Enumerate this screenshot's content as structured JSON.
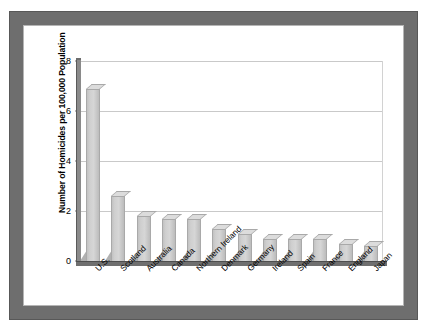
{
  "title_strip": "",
  "chart_data": {
    "type": "bar",
    "title": "",
    "subtitle": "",
    "xlabel": "",
    "ylabel": "Number of Homicides per 100,000 Population",
    "ylim": [
      0,
      8
    ],
    "yticks": [
      0,
      2,
      4,
      6,
      8
    ],
    "ytick_labels": [
      "0",
      "2",
      "4",
      "6",
      "8"
    ],
    "grid": true,
    "grid_axis": "y",
    "legend": false,
    "legend_position": "none",
    "style": "3d-bar",
    "bar_color": "#d0d0d0",
    "bar_edge_color": "#a9a9a9",
    "categories": [
      "U.S.",
      "Scotland",
      "Australia",
      "Canada",
      "Northern Ireland",
      "Denmark",
      "Germany",
      "Ireland",
      "Spain",
      "France",
      "England",
      "Japan"
    ],
    "values": [
      6.9,
      2.6,
      1.8,
      1.7,
      1.7,
      1.3,
      1.1,
      0.9,
      0.9,
      0.9,
      0.7,
      0.6
    ]
  },
  "frame": {
    "border_color": "#6e6e6e",
    "background_color": "#ffffff"
  }
}
